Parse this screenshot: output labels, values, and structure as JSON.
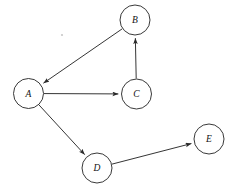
{
  "diagram": {
    "background_color": "#ffffff",
    "stroke_color": "#2a2a2a",
    "node_fill": "#ffffff",
    "label_color": "#111111",
    "node_radius": 15,
    "nodes": [
      {
        "id": "A",
        "label": "A",
        "cx": 28.5,
        "cy": 93.5
      },
      {
        "id": "B",
        "label": "B",
        "cx": 135.0,
        "cy": 20.0
      },
      {
        "id": "C",
        "label": "C",
        "cx": 136.5,
        "cy": 94.0
      },
      {
        "id": "D",
        "label": "D",
        "cx": 97.0,
        "cy": 168.0
      },
      {
        "id": "E",
        "label": "E",
        "cx": 209.0,
        "cy": 139.0
      }
    ],
    "edges": [
      {
        "id": "B-A",
        "from": "B",
        "to": "A",
        "directed": true
      },
      {
        "id": "A-C",
        "from": "A",
        "to": "C",
        "directed": true
      },
      {
        "id": "C-B",
        "from": "C",
        "to": "B",
        "directed": true
      },
      {
        "id": "A-D",
        "from": "A",
        "to": "D",
        "directed": true
      },
      {
        "id": "D-E",
        "from": "D",
        "to": "E",
        "directed": true
      }
    ],
    "artifacts": [
      {
        "id": "speck",
        "cx": 62,
        "cy": 35,
        "r": 1.1
      }
    ]
  }
}
